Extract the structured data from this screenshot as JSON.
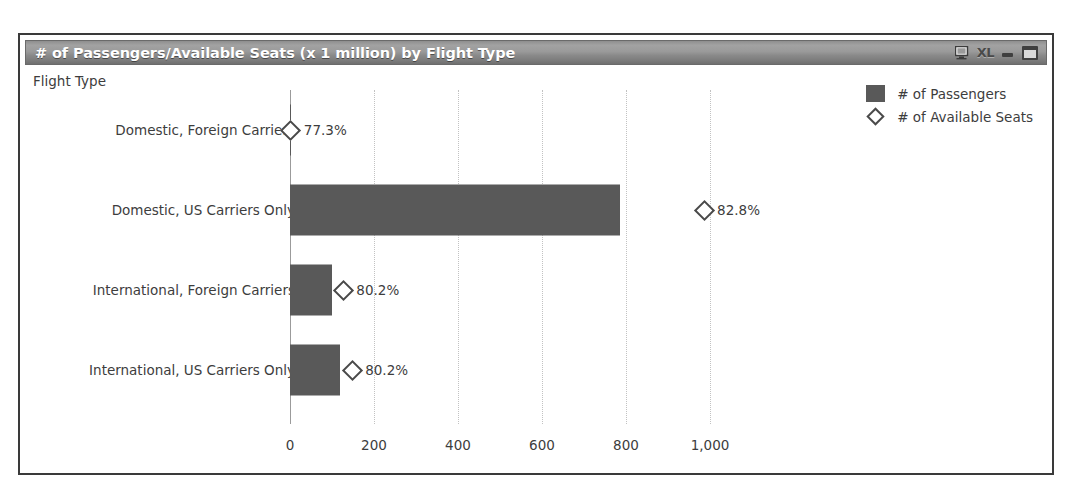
{
  "window": {
    "title": "# of Passengers/Available Seats (x 1 million) by Flight Type",
    "controls": {
      "monitor_icon": "monitor-icon",
      "xl_label": "XL",
      "minimize_label": "",
      "maximize_label": ""
    }
  },
  "chart_data": {
    "type": "bar",
    "orientation": "horizontal",
    "title": "# of Passengers/Available Seats (x 1 million) by Flight Type",
    "xlabel": "",
    "ylabel": "Flight Type",
    "categories": [
      "Domestic, Foreign Carriers",
      "Domestic, US Carriers Only",
      "International, Foreign Carriers",
      "International, US Carriers Only"
    ],
    "series": [
      {
        "name": "# of Passengers",
        "marker": "square",
        "color": "#595959",
        "values": [
          2,
          786,
          100,
          119
        ]
      },
      {
        "name": "# of Available Seats",
        "marker": "diamond",
        "color": "#4a4a4a",
        "values": [
          2,
          986,
          127,
          148
        ],
        "data_labels": [
          "77.3%",
          "82.8%",
          "80.2%",
          "80.2%"
        ]
      }
    ],
    "xticks": [
      0,
      200,
      400,
      600,
      800,
      1000
    ],
    "xtick_labels": [
      "0",
      "200",
      "400",
      "600",
      "800",
      "1,000"
    ],
    "xlim": [
      0,
      1120
    ],
    "grid": true,
    "legend_position": "top-right",
    "legend": [
      "# of Passengers",
      "# of Available Seats"
    ]
  },
  "colors": {
    "bar": "#595959",
    "marker_stroke": "#4a4a4a",
    "text": "#3d3d3d",
    "gridline": "#c2c2c2",
    "axis": "#9b9b9b",
    "titlebar_text": "#ffffff",
    "frame": "#3a3a3a"
  }
}
